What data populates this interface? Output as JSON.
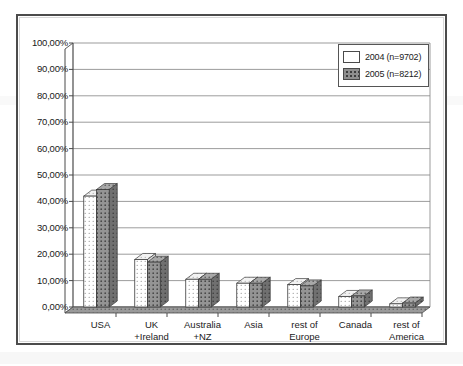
{
  "chart_data": {
    "type": "bar",
    "title": "",
    "subtitle": "",
    "xlabel": "",
    "ylabel": "",
    "ylim": [
      0,
      100
    ],
    "ytick_step": 10,
    "ytick_labels": [
      "100,00%",
      "90,00%",
      "80,00%",
      "70,00%",
      "60,00%",
      "50,00%",
      "40,00%",
      "30,00%",
      "20,00%",
      "10,00%",
      "0,00%"
    ],
    "ytick_values": [
      100,
      90,
      80,
      70,
      60,
      50,
      40,
      30,
      20,
      10,
      0
    ],
    "grid": true,
    "grid_axis": "y",
    "legend_position": "top-right",
    "bar_style": "3d-column",
    "categories": [
      "USA",
      "UK\n+Ireland",
      "Australia\n+NZ",
      "Asia",
      "rest of\nEurope",
      "Canada",
      "rest of\nAmerica"
    ],
    "category_lines": [
      [
        "USA",
        ""
      ],
      [
        "UK",
        "+Ireland"
      ],
      [
        "Australia",
        "+NZ"
      ],
      [
        "Asia",
        ""
      ],
      [
        "rest of",
        "Europe"
      ],
      [
        "Canada",
        ""
      ],
      [
        "rest of",
        "America"
      ]
    ],
    "series": [
      {
        "name": "2004 (n=9702)",
        "year": "2004",
        "n": 9702,
        "fill": "white-dotted",
        "color": "#ffffff",
        "values": [
          42.0,
          18.0,
          10.5,
          9.0,
          8.5,
          4.0,
          1.2
        ]
      },
      {
        "name": "2005 (n=8212)",
        "year": "2005",
        "n": 8212,
        "fill": "gray-dotted",
        "color": "#8f8f8f",
        "values": [
          44.5,
          17.0,
          10.5,
          9.0,
          8.0,
          4.2,
          1.5
        ]
      }
    ]
  },
  "legend": {
    "entries": [
      {
        "label": "2004 (n=9702)",
        "swatch": "white-dotted-swatch"
      },
      {
        "label": "2005 (n=8212)",
        "swatch": "gray-dotted-swatch"
      }
    ]
  },
  "colors": {
    "series_2004": "#ffffff",
    "series_2005": "#8f8f8f",
    "axis": "#4a4a4a",
    "grid": "#8a8a8a",
    "frame": "#4c4c4c",
    "text": "#1a1a1a"
  }
}
